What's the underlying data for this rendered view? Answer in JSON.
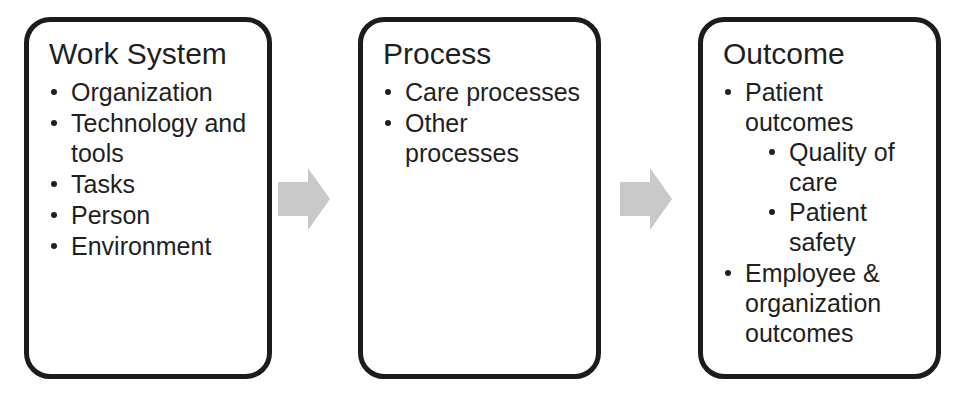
{
  "diagram": {
    "background_color": "#ffffff",
    "box_border_color": "#1c1c1c",
    "text_color": "#1f1f1f",
    "arrow_color": "#c9c9c9",
    "boxes": [
      {
        "id": "work-system",
        "title": "Work System",
        "items": [
          {
            "label": "Organization",
            "sub": []
          },
          {
            "label": "Technology and tools",
            "sub": []
          },
          {
            "label": "Tasks",
            "sub": []
          },
          {
            "label": "Person",
            "sub": []
          },
          {
            "label": "Environment",
            "sub": []
          }
        ]
      },
      {
        "id": "process",
        "title": "Process",
        "items": [
          {
            "label": "Care processes",
            "sub": []
          },
          {
            "label": "Other processes",
            "sub": []
          }
        ]
      },
      {
        "id": "outcome",
        "title": "Outcome",
        "items": [
          {
            "label": "Patient outcomes",
            "sub": [
              {
                "label": "Quality of care"
              },
              {
                "label": "Patient safety"
              }
            ]
          },
          {
            "label": "Employee & organization outcomes",
            "sub": []
          }
        ]
      }
    ],
    "arrows": [
      {
        "id": "arrow-work-system-to-process",
        "direction": "right"
      },
      {
        "id": "arrow-process-to-outcome",
        "direction": "right"
      }
    ]
  }
}
